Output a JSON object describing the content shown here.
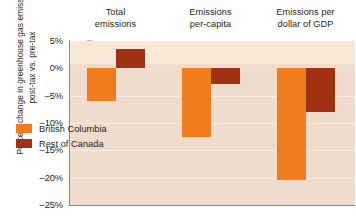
{
  "chart_data": {
    "type": "bar",
    "title": "",
    "xlabel": "",
    "ylabel": "Percent change in greenhouse gas emissions, post-tax vs. pre-tax",
    "categories": [
      "Total emissions",
      "Emissions per-capita",
      "Emissions per dollar of GDP"
    ],
    "series": [
      {
        "name": "British Columbia",
        "color": "#f07c1e",
        "values": [
          -6.0,
          -12.5,
          -20.5
        ]
      },
      {
        "name": "Rest of Canada",
        "color": "#a03213",
        "values": [
          3.5,
          -2.8,
          -8.0
        ]
      }
    ],
    "ylim": [
      -25,
      5
    ],
    "ytick_labels": [
      "5%",
      "0%",
      "-5%",
      "-10%",
      "-15%",
      "-20%",
      "-25%"
    ],
    "ytick_values": [
      5,
      0,
      -5,
      -10,
      -15,
      -20,
      -25
    ],
    "grid": true,
    "legend_position": "inside-bottom-left",
    "plot_background_above_zero": "#f8e8d5",
    "plot_background_below_zero": "#efdccc"
  },
  "axis": {
    "title": "Percent change in greenhouse gas emissions, post-tax vs. pre-tax"
  },
  "headers": [
    {
      "line1": "Total",
      "line2": "emissions"
    },
    {
      "line1": "Emissions",
      "line2": "per-capita"
    },
    {
      "line1": "Emissions per",
      "line2": "dollar of GDP"
    }
  ],
  "legend": {
    "items": [
      {
        "label": "British Columbia",
        "color": "#f07c1e"
      },
      {
        "label": "Rest of Canada",
        "color": "#a03213"
      }
    ]
  }
}
